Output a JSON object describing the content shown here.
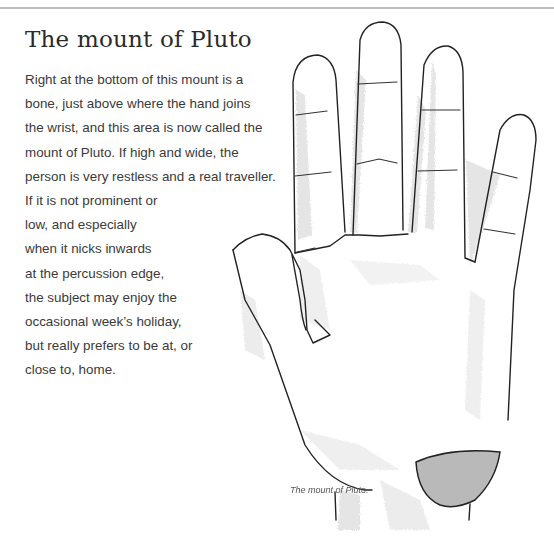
{
  "page": {
    "title": "The mount of Pluto",
    "body_lines": [
      "Right at the bottom of this mount is a",
      "bone, just above where the hand joins",
      "the wrist, and this area is now called the",
      "mount of Pluto. If high and wide, the",
      "person is very restless and a real traveller.",
      "If it is not prominent or",
      "low, and especially",
      "when it nicks inwards",
      "at the percussion edge,",
      "the subject may enjoy the",
      "occasional week’s holiday,",
      "but really prefers to be at, or",
      "close to, home."
    ],
    "figure": {
      "caption": "The mount of Pluto.",
      "highlight_color": "#b9b9b9",
      "outline_color": "#222222",
      "shading_color": "#cfcfcf"
    }
  }
}
